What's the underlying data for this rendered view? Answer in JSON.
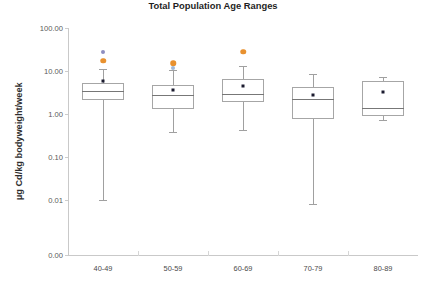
{
  "figure": {
    "cut_off_header": "",
    "background_color": "#ffffff"
  },
  "chart_data": {
    "type": "box",
    "title": "",
    "xlabel": "Total Population Age Ranges",
    "ylabel": "µg Cd/kg bodyweight/week",
    "yscale": "log",
    "ytick_labels": [
      "100.00",
      "10.00",
      "1.00",
      "0.10",
      "0.01",
      "0.00"
    ],
    "ytick_values": [
      100.0,
      10.0,
      1.0,
      0.1,
      0.01,
      0.0
    ],
    "ylim": [
      0.0,
      100.0
    ],
    "grid": false,
    "legend": "none",
    "categories": [
      "40-49",
      "50-59",
      "60-69",
      "70-79",
      "80-89"
    ],
    "colors": {
      "box_edge": "#a6a6a6",
      "median": "#777777",
      "whisker": "#a0a0a0",
      "mean_marker": "#1b1b2f",
      "outlier_high": "#e8912f",
      "outlier_mid": "#9fb8d8",
      "outlier_top": "#8e8ec0",
      "outlier_cyan": "#bfe3e0",
      "axis": "#c9c9c9",
      "tick_text": "#5a5a5a"
    },
    "boxes": [
      {
        "category": "40-49",
        "whisker_low": 0.01,
        "q1": 2.1,
        "median": 3.5,
        "q3": 5.2,
        "whisker_high": 11.0,
        "mean": 6.0,
        "outliers": [
          {
            "value": 17.5,
            "color": "outlier_high"
          },
          {
            "value": 28.0,
            "color": "outlier_top"
          }
        ]
      },
      {
        "category": "50-59",
        "whisker_low": 0.38,
        "q1": 1.3,
        "median": 2.7,
        "q3": 4.8,
        "whisker_high": 10.5,
        "mean": 3.7,
        "outliers": [
          {
            "value": 15.0,
            "color": "outlier_high"
          },
          {
            "value": 11.5,
            "color": "outlier_mid"
          }
        ]
      },
      {
        "category": "60-69",
        "whisker_low": 0.43,
        "q1": 1.95,
        "median": 2.95,
        "q3": 6.6,
        "whisker_high": 13.0,
        "mean": 4.5,
        "outliers": [
          {
            "value": 28.0,
            "color": "outlier_high"
          }
        ]
      },
      {
        "category": "70-79",
        "whisker_low": 0.008,
        "q1": 0.75,
        "median": 2.25,
        "q3": 4.2,
        "whisker_high": 8.5,
        "mean": 2.8,
        "outliers": []
      },
      {
        "category": "80-89",
        "whisker_low": 0.72,
        "q1": 0.9,
        "median": 1.35,
        "q3": 5.7,
        "whisker_high": 7.3,
        "mean": 3.3,
        "outliers": []
      }
    ]
  }
}
